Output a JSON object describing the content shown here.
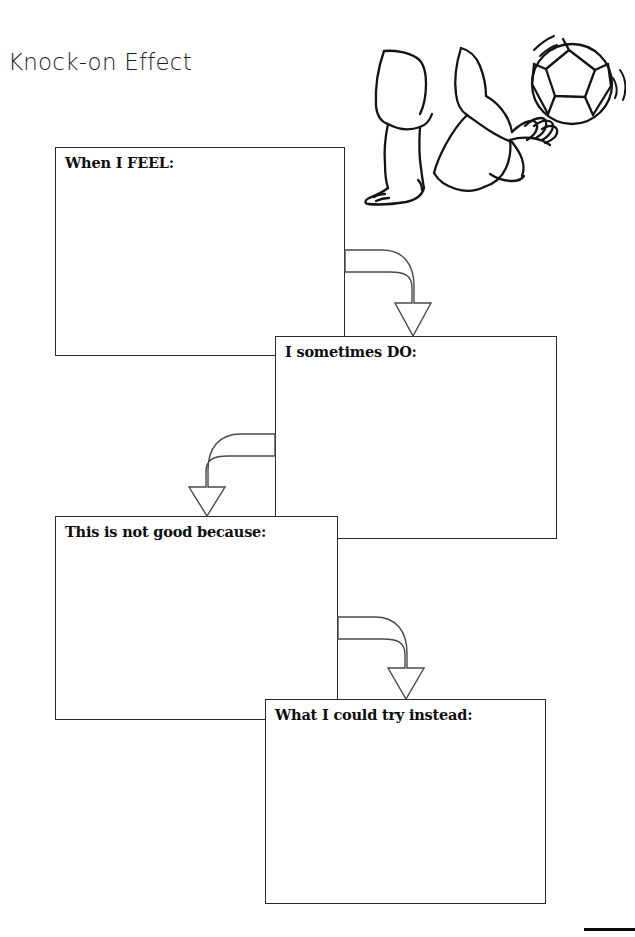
{
  "page": {
    "title": "Knock-on Effect",
    "background_color": "#ffffff",
    "ink_color": "#2b2b2b"
  },
  "illustration": {
    "name": "foot-kicking-soccer-ball",
    "description": "Line drawing of two bare feet in shorts kicking a soccer ball with motion lines",
    "elements": [
      "standing-leg",
      "kicking-leg",
      "soccer-ball",
      "motion-arcs"
    ]
  },
  "flow": {
    "boxes": [
      {
        "id": "when-i-feel",
        "label": "When I FEEL:",
        "x": 55,
        "y": 147,
        "width": 290,
        "height": 209
      },
      {
        "id": "i-sometimes-do",
        "label": "I sometimes DO:",
        "x": 275,
        "y": 336,
        "width": 282,
        "height": 203
      },
      {
        "id": "this-is-not-good-because",
        "label": "This is not good because:",
        "x": 55,
        "y": 516,
        "width": 283,
        "height": 204
      },
      {
        "id": "what-i-could-try-instead",
        "label": "What I could try instead:",
        "x": 265,
        "y": 699,
        "width": 281,
        "height": 205
      }
    ],
    "arrows": [
      {
        "id": "arrow-feel-to-do",
        "direction": "right-down",
        "from": "when-i-feel",
        "to": "i-sometimes-do"
      },
      {
        "id": "arrow-do-to-because",
        "direction": "left-down",
        "from": "i-sometimes-do",
        "to": "this-is-not-good-because"
      },
      {
        "id": "arrow-because-to-instead",
        "direction": "right-down",
        "from": "this-is-not-good-because",
        "to": "what-i-could-try-instead"
      }
    ]
  }
}
